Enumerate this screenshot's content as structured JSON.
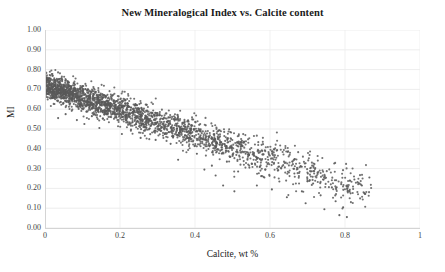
{
  "chart_data": {
    "type": "scatter",
    "title": "New Mineralogical Index vs. Calcite content",
    "xlabel": "Calcite, wt %",
    "ylabel": "MI",
    "xlim": [
      0,
      1
    ],
    "ylim": [
      0,
      1
    ],
    "grid": true,
    "legend": "none",
    "marker": {
      "color": "#595959",
      "size_px": 2.1,
      "shape": "circle",
      "opacity": 0.85
    },
    "xticks": [
      "0",
      "0.2",
      "0.4",
      "0.6",
      "0.8",
      "1"
    ],
    "xtick_values": [
      0,
      0.2,
      0.4,
      0.6,
      0.8,
      1
    ],
    "yticks": [
      "0.00",
      "0.10",
      "0.20",
      "0.30",
      "0.40",
      "0.50",
      "0.60",
      "0.70",
      "0.80",
      "0.90",
      "1.00"
    ],
    "ytick_values": [
      0,
      0.1,
      0.2,
      0.3,
      0.4,
      0.5,
      0.6,
      0.7,
      0.8,
      0.9,
      1.0
    ],
    "trend": {
      "description": "Dense negatively-correlated cloud: MI falls from about 0.72 at Calcite=0 to about 0.18 at Calcite=0.85, with scatter band width of roughly 0.12 MI and a sparse low tail reaching MI 0.05 near Calcite 0.80.",
      "intercept": 0.72,
      "slope": -0.62,
      "band_halfwidth": 0.062,
      "n_points": 2400,
      "x_density_decay": 2.35,
      "x_max_data": 0.87,
      "y_min_data": 0.05,
      "y_max_data": 0.8
    },
    "outliers": [
      {
        "x": 0.035,
        "y": 0.555
      },
      {
        "x": 0.055,
        "y": 0.575
      },
      {
        "x": 0.085,
        "y": 0.545
      },
      {
        "x": 0.105,
        "y": 0.525
      },
      {
        "x": 0.125,
        "y": 0.565
      },
      {
        "x": 0.145,
        "y": 0.505
      },
      {
        "x": 0.205,
        "y": 0.475
      },
      {
        "x": 0.255,
        "y": 0.455
      },
      {
        "x": 0.295,
        "y": 0.445
      },
      {
        "x": 0.335,
        "y": 0.425
      },
      {
        "x": 0.355,
        "y": 0.345
      },
      {
        "x": 0.405,
        "y": 0.375
      },
      {
        "x": 0.425,
        "y": 0.295
      },
      {
        "x": 0.445,
        "y": 0.315
      },
      {
        "x": 0.455,
        "y": 0.265
      },
      {
        "x": 0.485,
        "y": 0.335
      },
      {
        "x": 0.515,
        "y": 0.285
      },
      {
        "x": 0.545,
        "y": 0.305
      },
      {
        "x": 0.565,
        "y": 0.215
      },
      {
        "x": 0.585,
        "y": 0.255
      },
      {
        "x": 0.605,
        "y": 0.195
      },
      {
        "x": 0.625,
        "y": 0.235
      },
      {
        "x": 0.645,
        "y": 0.155
      },
      {
        "x": 0.665,
        "y": 0.275
      },
      {
        "x": 0.685,
        "y": 0.185
      },
      {
        "x": 0.695,
        "y": 0.125
      },
      {
        "x": 0.715,
        "y": 0.225
      },
      {
        "x": 0.735,
        "y": 0.165
      },
      {
        "x": 0.745,
        "y": 0.095
      },
      {
        "x": 0.765,
        "y": 0.205
      },
      {
        "x": 0.775,
        "y": 0.135
      },
      {
        "x": 0.785,
        "y": 0.065
      },
      {
        "x": 0.795,
        "y": 0.105
      },
      {
        "x": 0.805,
        "y": 0.055
      },
      {
        "x": 0.815,
        "y": 0.175
      },
      {
        "x": 0.825,
        "y": 0.245
      },
      {
        "x": 0.845,
        "y": 0.215
      },
      {
        "x": 0.865,
        "y": 0.255
      },
      {
        "x": 0.595,
        "y": 0.345
      },
      {
        "x": 0.535,
        "y": 0.375
      },
      {
        "x": 0.475,
        "y": 0.215
      },
      {
        "x": 0.505,
        "y": 0.185
      }
    ]
  }
}
